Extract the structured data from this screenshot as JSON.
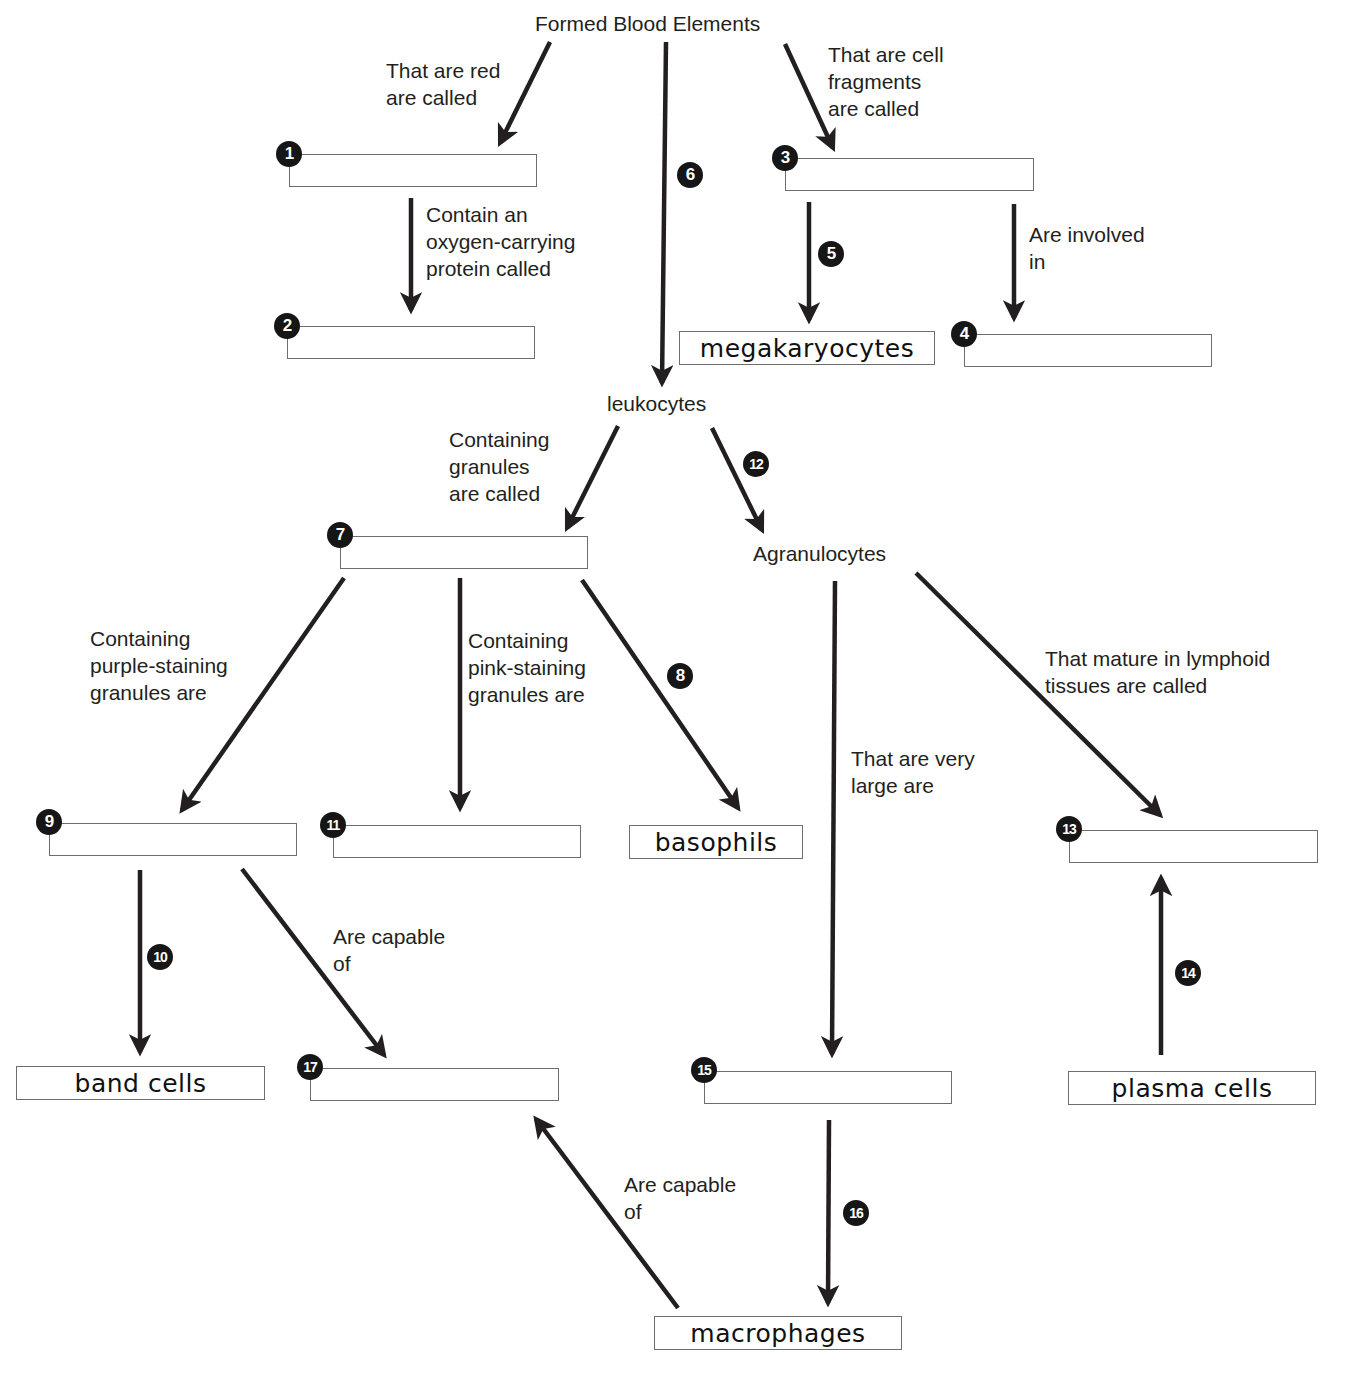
{
  "title": "Formed Blood Elements",
  "nodes": {
    "leukocytes": "leukocytes",
    "agranulocytes": "Agranulocytes"
  },
  "labels": {
    "red": "That are red\nare called",
    "fragments": "That are cell\nfragments\nare called",
    "oxygen": "Contain an\noxygen-carrying\nprotein called",
    "involved": "Are involved\nin",
    "granules": "Containing\ngranules\nare called",
    "purple": "Containing\npurple-staining\ngranules are",
    "pink": "Containing\npink-staining\ngranules are",
    "lymphoid": "That mature in lymphoid\ntissues are called",
    "very_large": "That are very\nlarge are",
    "capable_17": "Are capable\nof",
    "capable_macro": "Are capable\nof"
  },
  "filled_boxes": {
    "megakaryocytes": "megakaryocytes",
    "basophils": "basophils",
    "band_cells": "band cells",
    "plasma_cells": "plasma cells",
    "macrophages": "macrophages"
  },
  "blanks": [
    {
      "number": "1",
      "value": ""
    },
    {
      "number": "2",
      "value": ""
    },
    {
      "number": "3",
      "value": ""
    },
    {
      "number": "4",
      "value": ""
    },
    {
      "number": "7",
      "value": ""
    },
    {
      "number": "9",
      "value": ""
    },
    {
      "number": "11",
      "value": ""
    },
    {
      "number": "13",
      "value": ""
    },
    {
      "number": "15",
      "value": ""
    },
    {
      "number": "17",
      "value": ""
    }
  ],
  "arrow_badges": {
    "b5": "5",
    "b6": "6",
    "b8": "8",
    "b10": "10",
    "b12": "12",
    "b14": "14",
    "b16": "16"
  },
  "colors": {
    "ink": "#231f20",
    "box_border": "#6d6d6d",
    "badge": "#161616"
  }
}
